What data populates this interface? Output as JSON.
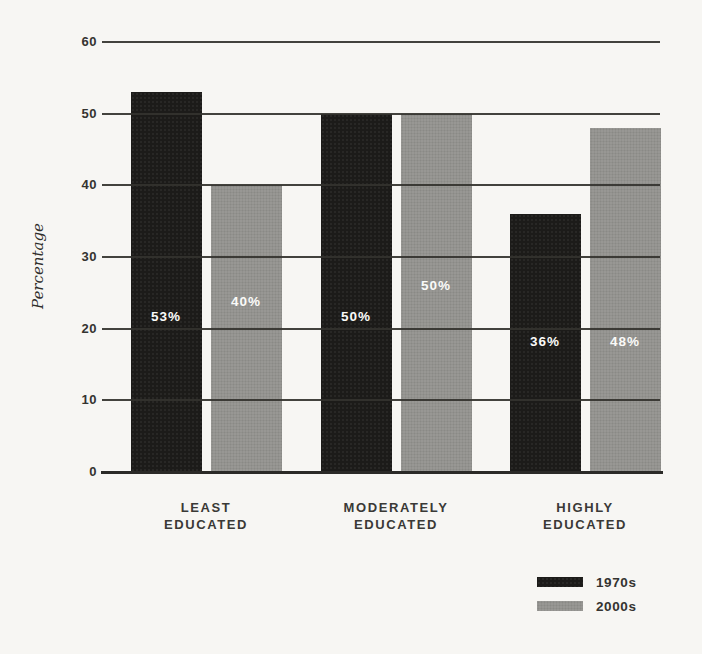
{
  "chart": {
    "background": "#f7f6f3",
    "line_color": "#33322e",
    "text_color": "#343330",
    "value_label_color": "#fafaf8"
  },
  "chart_data": {
    "type": "bar",
    "title": "",
    "categories": [
      [
        "LEAST",
        "EDUCATED"
      ],
      [
        "MODERATELY",
        "EDUCATED"
      ],
      [
        "HIGHLY",
        "EDUCATED"
      ]
    ],
    "series": [
      {
        "name": "1970s",
        "color": "#1c1b19",
        "values": [
          53,
          50,
          36
        ],
        "value_labels": [
          "53%",
          "50%",
          "36%"
        ]
      },
      {
        "name": "2000s",
        "color": "#989794",
        "values": [
          40,
          50,
          48
        ],
        "value_labels": [
          "40%",
          "50%",
          "48%"
        ]
      }
    ],
    "xlabel": "",
    "ylabel": "Percentage",
    "yticks": [
      0,
      10,
      20,
      30,
      40,
      50,
      60
    ],
    "ylim": [
      0,
      60
    ],
    "grid": true,
    "legend_position": "bottom-right"
  }
}
